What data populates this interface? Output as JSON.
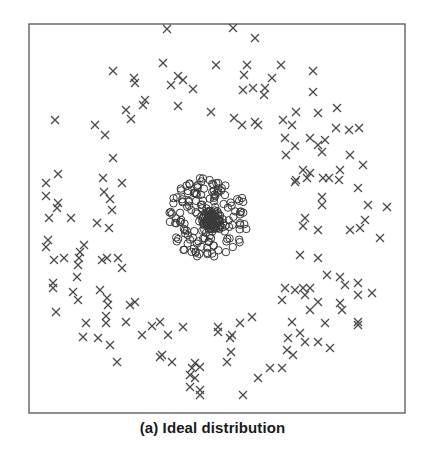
{
  "figure": {
    "caption": "(a) Ideal distribution"
  },
  "chart_data": {
    "type": "scatter",
    "title": "",
    "caption": "(a) Ideal distribution",
    "xlabel": "",
    "ylabel": "",
    "axes_visible": false,
    "grid": false,
    "legend": null,
    "frame_px": {
      "x0": 29,
      "y0": 24,
      "x1": 405,
      "y1": 413
    },
    "colors": {
      "frame": "#555555",
      "cross": "#4a4a4a",
      "circle": "#3a3a3a"
    },
    "series": [
      {
        "name": "outer-class",
        "marker": "x",
        "points_px": [
          [
            167,
            29
          ],
          [
            233,
            28
          ],
          [
            255,
            38
          ],
          [
            163,
            63
          ],
          [
            216,
            65
          ],
          [
            247,
            65
          ],
          [
            281,
            65
          ],
          [
            313,
            71
          ],
          [
            113,
            71
          ],
          [
            134,
            78
          ],
          [
            135,
            83
          ],
          [
            178,
            76
          ],
          [
            183,
            80
          ],
          [
            171,
            85
          ],
          [
            193,
            89
          ],
          [
            244,
            75
          ],
          [
            243,
            90
          ],
          [
            253,
            88
          ],
          [
            265,
            88
          ],
          [
            272,
            78
          ],
          [
            264,
            95
          ],
          [
            313,
            92
          ],
          [
            145,
            100
          ],
          [
            143,
            105
          ],
          [
            178,
            106
          ],
          [
            211,
            112
          ],
          [
            126,
            110
          ],
          [
            131,
            119
          ],
          [
            234,
            118
          ],
          [
            242,
            125
          ],
          [
            255,
            122
          ],
          [
            258,
            125
          ],
          [
            283,
            120
          ],
          [
            296,
            112
          ],
          [
            292,
            125
          ],
          [
            318,
            113
          ],
          [
            337,
            108
          ],
          [
            336,
            128
          ],
          [
            349,
            130
          ],
          [
            359,
            128
          ],
          [
            55,
            120
          ],
          [
            95,
            125
          ],
          [
            105,
            135
          ],
          [
            113,
            158
          ],
          [
            285,
            138
          ],
          [
            286,
            155
          ],
          [
            295,
            146
          ],
          [
            310,
            138
          ],
          [
            318,
            145
          ],
          [
            325,
            140
          ],
          [
            322,
            152
          ],
          [
            350,
            155
          ],
          [
            363,
            165
          ],
          [
            58,
            174
          ],
          [
            46,
            183
          ],
          [
            103,
            178
          ],
          [
            122,
            183
          ],
          [
            46,
            196
          ],
          [
            104,
            192
          ],
          [
            110,
            199
          ],
          [
            57,
            208
          ],
          [
            58,
            203
          ],
          [
            49,
            218
          ],
          [
            71,
            218
          ],
          [
            112,
            210
          ],
          [
            97,
            223
          ],
          [
            109,
            228
          ],
          [
            296,
            180
          ],
          [
            303,
            170
          ],
          [
            307,
            178
          ],
          [
            295,
            182
          ],
          [
            323,
            178
          ],
          [
            310,
            173
          ],
          [
            329,
            178
          ],
          [
            340,
            170
          ],
          [
            339,
            180
          ],
          [
            358,
            188
          ],
          [
            322,
            197
          ],
          [
            322,
            205
          ],
          [
            368,
            205
          ],
          [
            387,
            207
          ],
          [
            305,
            218
          ],
          [
            303,
            226
          ],
          [
            318,
            230
          ],
          [
            350,
            230
          ],
          [
            360,
            228
          ],
          [
            365,
            220
          ],
          [
            380,
            238
          ],
          [
            46,
            247
          ],
          [
            48,
            240
          ],
          [
            84,
            245
          ],
          [
            80,
            252
          ],
          [
            64,
            258
          ],
          [
            54,
            260
          ],
          [
            79,
            258
          ],
          [
            107,
            258
          ],
          [
            118,
            258
          ],
          [
            102,
            260
          ],
          [
            122,
            268
          ],
          [
            78,
            265
          ],
          [
            77,
            277
          ],
          [
            300,
            255
          ],
          [
            318,
            258
          ],
          [
            327,
            275
          ],
          [
            53,
            283
          ],
          [
            53,
            288
          ],
          [
            73,
            292
          ],
          [
            78,
            300
          ],
          [
            100,
            290
          ],
          [
            107,
            298
          ],
          [
            108,
            305
          ],
          [
            56,
            312
          ],
          [
            130,
            305
          ],
          [
            135,
            302
          ],
          [
            106,
            316
          ],
          [
            106,
            323
          ],
          [
            126,
            322
          ],
          [
            86,
            323
          ],
          [
            98,
            338
          ],
          [
            83,
            337
          ],
          [
            110,
            345
          ],
          [
            117,
            362
          ],
          [
            152,
            326
          ],
          [
            160,
            322
          ],
          [
            183,
            327
          ],
          [
            168,
            335
          ],
          [
            142,
            335
          ],
          [
            162,
            355
          ],
          [
            160,
            357
          ],
          [
            172,
            362
          ],
          [
            195,
            363
          ],
          [
            192,
            368
          ],
          [
            200,
            367
          ],
          [
            190,
            375
          ],
          [
            195,
            378
          ],
          [
            190,
            387
          ],
          [
            200,
            390
          ],
          [
            200,
            395
          ],
          [
            243,
            395
          ],
          [
            218,
            327
          ],
          [
            218,
            332
          ],
          [
            230,
            338
          ],
          [
            232,
            335
          ],
          [
            240,
            323
          ],
          [
            252,
            317
          ],
          [
            231,
            352
          ],
          [
            227,
            362
          ],
          [
            258,
            378
          ],
          [
            270,
            368
          ],
          [
            282,
            368
          ],
          [
            285,
            288
          ],
          [
            282,
            300
          ],
          [
            295,
            290
          ],
          [
            303,
            288
          ],
          [
            310,
            288
          ],
          [
            305,
            295
          ],
          [
            318,
            302
          ],
          [
            310,
            310
          ],
          [
            340,
            277
          ],
          [
            345,
            285
          ],
          [
            358,
            283
          ],
          [
            358,
            295
          ],
          [
            340,
            303
          ],
          [
            342,
            310
          ],
          [
            358,
            322
          ],
          [
            325,
            323
          ],
          [
            318,
            342
          ],
          [
            330,
            348
          ],
          [
            300,
            333
          ],
          [
            288,
            338
          ],
          [
            287,
            350
          ],
          [
            293,
            355
          ],
          [
            305,
            342
          ],
          [
            292,
            322
          ],
          [
            372,
            293
          ],
          [
            358,
            325
          ]
        ]
      },
      {
        "name": "inner-class",
        "marker": "o",
        "cluster": {
          "center_px": [
            208,
            218
          ],
          "radius_px": 40,
          "count": 220,
          "dense_core_px": [
            212,
            220
          ]
        }
      }
    ]
  }
}
